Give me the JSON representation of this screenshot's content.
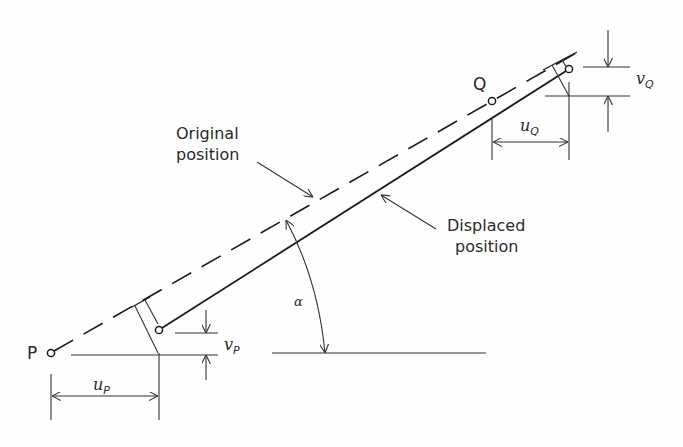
{
  "diagram": {
    "labels": {
      "point_p": "P",
      "point_q": "Q",
      "original_line1": "Original",
      "original_line2": "position",
      "displaced_line1": "Displaced",
      "displaced_line2": "position",
      "angle": "α",
      "u_p_main": "u",
      "u_p_sub": "P",
      "v_p_main": "v",
      "v_p_sub": "P",
      "u_q_main": "u",
      "u_q_sub": "Q",
      "v_q_main": "v",
      "v_q_sub": "Q"
    },
    "colors": {
      "line": "#1a1a1a",
      "thin": "#333333",
      "text": "#2a2a2a"
    }
  }
}
